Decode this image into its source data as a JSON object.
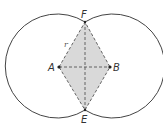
{
  "diagram": {
    "title": "",
    "points": {
      "A": {
        "label": "A",
        "x": 59,
        "y": 67
      },
      "B": {
        "label": "B",
        "x": 110,
        "y": 67
      },
      "F": {
        "label": "F",
        "x": 85,
        "y": 22
      },
      "E": {
        "label": "E",
        "x": 85,
        "y": 110
      }
    },
    "radius_label": "r",
    "circles": [
      {
        "center": "A",
        "radius": 52
      },
      {
        "center": "B",
        "radius": 52
      }
    ],
    "colors": {
      "stroke": "#444444",
      "fill": "#d9d9d9",
      "dash": "#555555"
    }
  }
}
